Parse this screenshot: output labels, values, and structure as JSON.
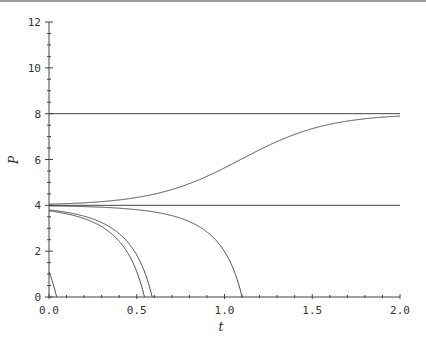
{
  "chart_data": {
    "type": "line",
    "title": "",
    "xlabel": "t",
    "ylabel": "P",
    "xlim": [
      0,
      2.0
    ],
    "ylim": [
      0,
      12
    ],
    "x_ticks": [
      "0.0",
      "0.5",
      "1.0",
      "1.5",
      "2.0"
    ],
    "y_ticks": [
      "0",
      "2",
      "4",
      "6",
      "8",
      "10",
      "12"
    ],
    "x_minor_step": 0.1,
    "y_minor_step": 0.5,
    "grid": false,
    "legend": null,
    "model": "dP/dt = -(P-4)(P-8)",
    "series": [
      {
        "name": "equilibrium P=8",
        "x": [
          0,
          2.0
        ],
        "y": [
          8,
          8
        ]
      },
      {
        "name": "equilibrium P=4",
        "x": [
          0,
          2.0
        ],
        "y": [
          4,
          4
        ]
      },
      {
        "name": "above 8 (early)",
        "x": [
          0.39,
          0.5,
          0.75,
          1.0,
          1.5,
          2.0
        ],
        "y": [
          12,
          10.1,
          8.75,
          8.3,
          8.04,
          8.01
        ]
      },
      {
        "name": "above 8 (late)",
        "x": [
          0.89,
          1.0,
          1.25,
          1.5,
          2.0
        ],
        "y": [
          12,
          10.4,
          8.9,
          8.4,
          8.05
        ]
      },
      {
        "name": "between 4 and 8",
        "x": [
          0,
          0.5,
          1.0,
          1.5,
          2.0
        ],
        "y": [
          4.05,
          4.44,
          5.64,
          7.1,
          7.9
        ]
      },
      {
        "name": "below 4 (fast)",
        "x": [
          0,
          0.25,
          0.5,
          0.6
        ],
        "y": [
          3.8,
          3.45,
          1.9,
          0
        ]
      },
      {
        "name": "below 4 (slow)",
        "x": [
          0,
          0.5,
          0.8,
          1.0,
          1.1
        ],
        "y": [
          3.975,
          3.85,
          3.3,
          1.9,
          0
        ]
      }
    ],
    "curve_params": [
      {
        "id": "upper1",
        "A": 2.38
      },
      {
        "id": "upper2",
        "A": 17.6
      },
      {
        "id": "middle",
        "A": -79
      },
      {
        "id": "lower1",
        "A": 21
      },
      {
        "id": "lower2",
        "A": 162.9
      }
    ],
    "line_color": "#444444"
  }
}
